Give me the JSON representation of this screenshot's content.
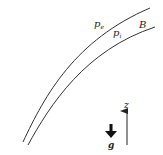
{
  "diagram": {
    "labels": {
      "outer_pressure": "p",
      "outer_pressure_sub": "e",
      "inner_pressure": "p",
      "inner_pressure_sub": "i",
      "boundary": "B",
      "vertical_axis": "z",
      "gravity": "g"
    },
    "colors": {
      "stroke": "#333333",
      "text": "#222222",
      "background": "#ffffff"
    }
  }
}
